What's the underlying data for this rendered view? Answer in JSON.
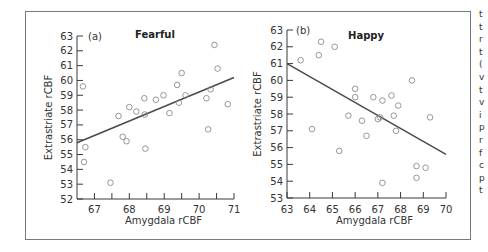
{
  "chart_data": [
    {
      "type": "scatter",
      "panel_label": "(a)",
      "title": "Fearful",
      "xlabel": "Amygdala rCBF",
      "ylabel": "Extrastriate rCBF",
      "xlim": [
        66.5,
        71
      ],
      "ylim": [
        52,
        63
      ],
      "xticks": [
        67,
        68,
        69,
        70,
        71
      ],
      "yticks": [
        52,
        53,
        54,
        55,
        56,
        57,
        58,
        59,
        60,
        61,
        62,
        63
      ],
      "grid": false,
      "points": [
        [
          66.67,
          59.6
        ],
        [
          66.74,
          55.5
        ],
        [
          66.7,
          54.5
        ],
        [
          67.46,
          53.1
        ],
        [
          67.69,
          57.6
        ],
        [
          67.81,
          56.2
        ],
        [
          67.92,
          55.9
        ],
        [
          68.0,
          58.2
        ],
        [
          68.2,
          57.9
        ],
        [
          68.43,
          58.8
        ],
        [
          68.44,
          57.7
        ],
        [
          68.46,
          55.4
        ],
        [
          68.76,
          58.7
        ],
        [
          68.98,
          59.0
        ],
        [
          69.15,
          57.8
        ],
        [
          69.37,
          59.7
        ],
        [
          69.42,
          58.5
        ],
        [
          69.5,
          60.5
        ],
        [
          69.61,
          59.0
        ],
        [
          70.21,
          58.8
        ],
        [
          70.26,
          56.7
        ],
        [
          70.33,
          59.4
        ],
        [
          70.44,
          62.4
        ],
        [
          70.53,
          60.8
        ],
        [
          70.82,
          58.4
        ]
      ],
      "regression_line": [
        [
          66.5,
          55.8
        ],
        [
          71.0,
          60.2
        ]
      ]
    },
    {
      "type": "scatter",
      "panel_label": "(b)",
      "title": "Happy",
      "xlabel": "Amygdala rCBF",
      "ylabel": "Extrastriate rCBF",
      "xlim": [
        63,
        70
      ],
      "ylim": [
        53,
        63
      ],
      "xticks": [
        63,
        64,
        65,
        66,
        67,
        68,
        69,
        70
      ],
      "yticks": [
        53,
        54,
        55,
        56,
        57,
        58,
        59,
        60,
        61,
        62,
        63
      ],
      "grid": false,
      "points": [
        [
          63.6,
          61.2
        ],
        [
          64.4,
          61.5
        ],
        [
          64.5,
          62.3
        ],
        [
          65.1,
          62.0
        ],
        [
          64.1,
          57.1
        ],
        [
          65.3,
          55.8
        ],
        [
          65.7,
          57.9
        ],
        [
          66.0,
          59.5
        ],
        [
          66.0,
          59.0
        ],
        [
          66.3,
          57.6
        ],
        [
          66.5,
          56.7
        ],
        [
          66.8,
          59.0
        ],
        [
          67.0,
          57.7
        ],
        [
          67.1,
          57.8
        ],
        [
          67.2,
          58.8
        ],
        [
          67.2,
          53.9
        ],
        [
          67.6,
          59.1
        ],
        [
          67.7,
          57.9
        ],
        [
          67.9,
          58.5
        ],
        [
          67.8,
          57.0
        ],
        [
          68.5,
          60.0
        ],
        [
          68.7,
          54.9
        ],
        [
          68.7,
          54.2
        ],
        [
          69.1,
          54.8
        ],
        [
          69.3,
          57.8
        ]
      ],
      "regression_line": [
        [
          63.0,
          61.0
        ],
        [
          70.0,
          55.6
        ]
      ]
    }
  ],
  "colors": {
    "frame": "#7a7a7a",
    "axis": "#3a3a3a",
    "marker": "#8a8a8a",
    "line": "#4a4a4a"
  },
  "side_text_glyphs": [
    "t",
    "t",
    "r",
    "t",
    "(",
    "v",
    "t",
    "v",
    "i",
    "p",
    "r",
    "f",
    "c",
    "p",
    "t"
  ]
}
